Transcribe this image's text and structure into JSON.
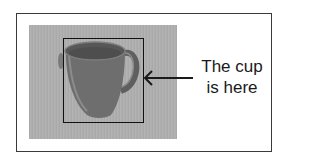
{
  "figure": {
    "annotation": {
      "line1": "The cup",
      "line2": "is here"
    },
    "subject": "cup",
    "colors": {
      "frame": "#3a3a3a",
      "bbox": "#111111",
      "photo_bg": "#adadad",
      "cup": "#6e6e6e",
      "text": "#1a1a1a"
    }
  }
}
